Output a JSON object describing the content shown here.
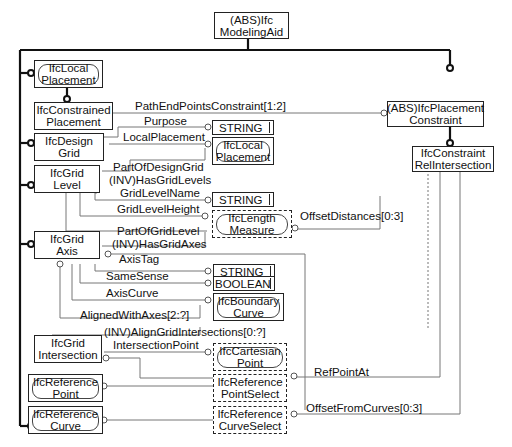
{
  "diagram": {
    "type": "EXPRESS-G",
    "root": {
      "name": "(ABS)Ifc\nModelingAid"
    },
    "entities": [
      {
        "id": "local_placement",
        "label": "IfcLocal\nPlacement",
        "kind": "defined"
      },
      {
        "id": "constrained_placement",
        "label": "IfcConstrained\nPlacement",
        "kind": "entity"
      },
      {
        "id": "design_grid",
        "label": "IfcDesign\nGrid",
        "kind": "entity"
      },
      {
        "id": "grid_level",
        "label": "IfcGrid\nLevel",
        "kind": "entity"
      },
      {
        "id": "grid_axis",
        "label": "IfcGrid\nAxis",
        "kind": "entity"
      },
      {
        "id": "grid_intersection",
        "label": "IfcGrid\nIntersection",
        "kind": "entity"
      },
      {
        "id": "reference_point",
        "label": "IfcReference\nPoint",
        "kind": "defined"
      },
      {
        "id": "reference_curve",
        "label": "IfcReference\nCurve",
        "kind": "defined"
      },
      {
        "id": "placement_constraint",
        "label": "(ABS)IfcPlacement\nConstraint",
        "kind": "entity"
      },
      {
        "id": "constraint_rel_intersection",
        "label": "IfcConstraint\nRelIntersection",
        "kind": "entity"
      },
      {
        "id": "string_1",
        "label": "STRING",
        "kind": "simple"
      },
      {
        "id": "local_placement_ref",
        "label": "IfcLocal\nPlacement",
        "kind": "defined"
      },
      {
        "id": "string_2",
        "label": "STRING",
        "kind": "simple"
      },
      {
        "id": "length_measure",
        "label": "IfcLength\nMeasure",
        "kind": "measure"
      },
      {
        "id": "string_3",
        "label": "STRING",
        "kind": "simple"
      },
      {
        "id": "boolean",
        "label": "BOOLEAN",
        "kind": "simple"
      },
      {
        "id": "boundary_curve",
        "label": "IfcBoundary\nCurve",
        "kind": "defined"
      },
      {
        "id": "cartesian_point",
        "label": "IfcCartesian\nPoint",
        "kind": "measure"
      },
      {
        "id": "reference_point_select",
        "label": "IfcReference\nPointSelect",
        "kind": "select"
      },
      {
        "id": "reference_curve_select",
        "label": "IfcReference\nCurveSelect",
        "kind": "select"
      }
    ],
    "relationships": [
      {
        "id": "path_end_points",
        "label": "PathEndPointsConstraint[1:2]"
      },
      {
        "id": "purpose",
        "label": "Purpose"
      },
      {
        "id": "local_placement_attr",
        "label": "LocalPlacement"
      },
      {
        "id": "part_of_design_grid",
        "label": "PartOfDesignGrid"
      },
      {
        "id": "has_grid_levels",
        "label": "(INV)HasGridLevels"
      },
      {
        "id": "grid_level_name",
        "label": "GridLevelName"
      },
      {
        "id": "grid_level_height",
        "label": "GridLevelHeight"
      },
      {
        "id": "offset_distances",
        "label": "OffsetDistances[0:3]"
      },
      {
        "id": "part_of_grid_level",
        "label": "PartOfGridLevel"
      },
      {
        "id": "has_grid_axes",
        "label": "(INV)HasGridAxes"
      },
      {
        "id": "axis_tag",
        "label": "AxisTag"
      },
      {
        "id": "same_sense",
        "label": "SameSense"
      },
      {
        "id": "axis_curve",
        "label": "AxisCurve"
      },
      {
        "id": "aligned_with_axes",
        "label": "AlignedWithAxes[2:?]"
      },
      {
        "id": "align_grid_intersections",
        "label": "(INV)AlignGridIntersections[0:?]"
      },
      {
        "id": "intersection_point",
        "label": "IntersectionPoint"
      },
      {
        "id": "ref_point_at",
        "label": "RefPointAt"
      },
      {
        "id": "offset_from_curves",
        "label": "OffsetFromCurves[0:3]"
      }
    ]
  }
}
